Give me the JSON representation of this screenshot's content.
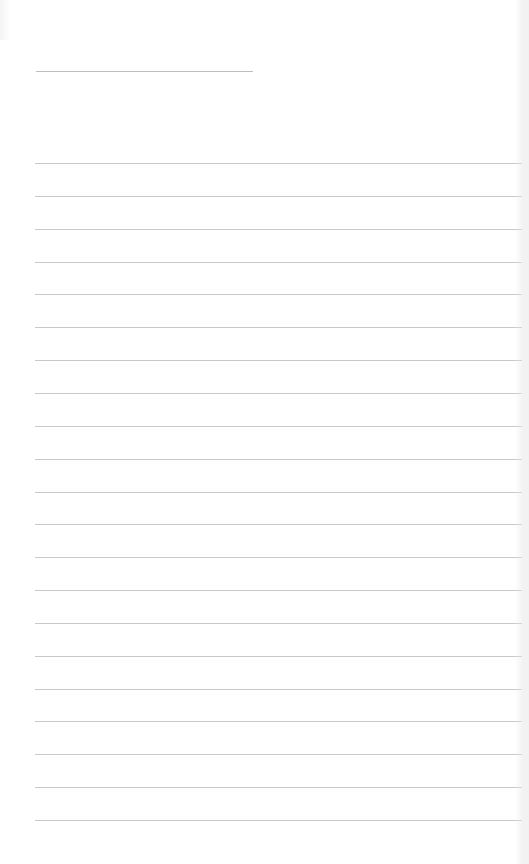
{
  "page": {
    "type": "blank lined notepad sheet",
    "background_color": "#ffffff",
    "line_color": "#c9c9c9",
    "title_line_color": "#bdbdbd"
  },
  "title_line": {
    "x": 36,
    "y": 71,
    "width": 217
  },
  "ruled_lines": {
    "count": 21,
    "start_x": 35,
    "end_x": 522,
    "first_y": 163,
    "spacing": 32.85
  }
}
